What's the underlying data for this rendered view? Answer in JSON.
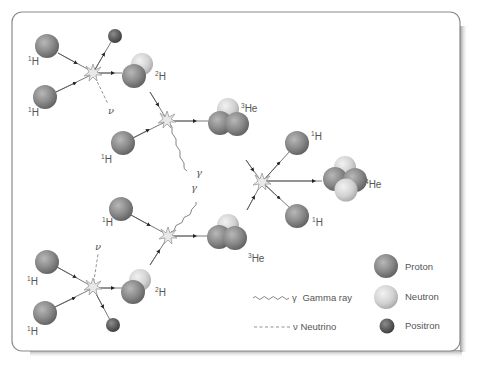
{
  "diagram": {
    "colors": {
      "proton": "#8a8a8a",
      "neutron": "#d4d4d4",
      "positron": "#5a5a5a",
      "line": "#555555",
      "label": "#555555",
      "panel_border": "#8a8a8a"
    },
    "particles": {
      "h1": {
        "mass": "1",
        "symbol": "H"
      },
      "h2": {
        "mass": "2",
        "symbol": "H"
      },
      "he3": {
        "mass": "3",
        "symbol": "He"
      },
      "he4": {
        "mass": "4",
        "symbol": "He"
      }
    },
    "symbols": {
      "gamma": "γ",
      "neutrino": "ν"
    },
    "reactions": [
      {
        "id": "r1",
        "inputs": [
          "1H",
          "1H"
        ],
        "outputs": [
          "2H",
          "positron",
          "neutrino"
        ]
      },
      {
        "id": "r2",
        "inputs": [
          "2H",
          "1H"
        ],
        "outputs": [
          "3He",
          "gamma"
        ]
      },
      {
        "id": "r3",
        "inputs": [
          "2H",
          "1H"
        ],
        "outputs": [
          "3He",
          "gamma"
        ]
      },
      {
        "id": "r4",
        "inputs": [
          "1H",
          "1H"
        ],
        "outputs": [
          "2H",
          "positron",
          "neutrino"
        ]
      },
      {
        "id": "r5",
        "inputs": [
          "3He",
          "3He"
        ],
        "outputs": [
          "4He",
          "1H",
          "1H"
        ]
      }
    ]
  },
  "legend": {
    "items": [
      {
        "key": "proton",
        "label": "Proton"
      },
      {
        "key": "neutron",
        "label": "Neutron"
      },
      {
        "key": "positron",
        "label": "Positron"
      }
    ],
    "lines": [
      {
        "key": "gamma",
        "symbol": "γ",
        "label": "Gamma ray"
      },
      {
        "key": "neutrino",
        "symbol": "ν",
        "label": "Neutrino"
      }
    ]
  }
}
